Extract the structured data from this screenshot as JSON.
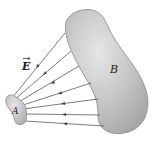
{
  "diagram": {
    "labels": {
      "field": "E",
      "conductor_a": "A",
      "conductor_b": "B"
    },
    "colors": {
      "conductor_fill": "#b4b4b4",
      "conductor_edge": "#8a8a8a",
      "field_line": "#444444",
      "background": "#ffffff"
    },
    "field_lines": [
      {
        "from": [
          12,
          98
        ],
        "to": [
          65,
          33
        ]
      },
      {
        "from": [
          14,
          100
        ],
        "to": [
          71,
          51
        ]
      },
      {
        "from": [
          17,
          103
        ],
        "to": [
          79,
          66
        ]
      },
      {
        "from": [
          20,
          106
        ],
        "to": [
          91,
          83
        ]
      },
      {
        "from": [
          23,
          109
        ],
        "to": [
          98,
          99
        ]
      },
      {
        "from": [
          25,
          114
        ],
        "to": [
          100,
          115
        ]
      },
      {
        "from": [
          25,
          121
        ],
        "to": [
          104,
          126
        ]
      }
    ],
    "field_direction": "from B toward A"
  }
}
